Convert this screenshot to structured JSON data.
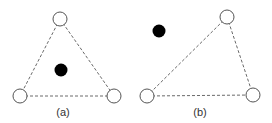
{
  "panels": [
    {
      "id": "a",
      "label": "(a)",
      "label_pos": [
        63,
        116
      ],
      "vertices": [
        {
          "x": 60,
          "y": 19
        },
        {
          "x": 20,
          "y": 96
        },
        {
          "x": 114,
          "y": 96
        }
      ],
      "edges": [
        [
          0,
          1
        ],
        [
          0,
          2
        ],
        [
          1,
          2
        ]
      ],
      "point": {
        "x": 61,
        "y": 70,
        "position": "inside"
      }
    },
    {
      "id": "b",
      "label": "(b)",
      "label_pos": [
        200,
        116
      ],
      "vertices": [
        {
          "x": 227,
          "y": 17
        },
        {
          "x": 147,
          "y": 96
        },
        {
          "x": 253,
          "y": 95
        }
      ],
      "edges": [
        [
          0,
          1
        ],
        [
          0,
          2
        ],
        [
          1,
          2
        ]
      ],
      "point": {
        "x": 159,
        "y": 31,
        "position": "outside"
      }
    }
  ],
  "style": {
    "vertex_radius": 7,
    "point_radius": 6.5,
    "edge_color": "#6a6a6a",
    "vertex_stroke": "#555555",
    "point_color": "#000000"
  }
}
